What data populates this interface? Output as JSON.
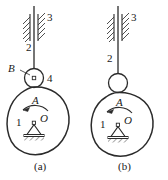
{
  "figure": {
    "stroke_color": "#2b2b2b",
    "hatch_color": "#3a3a3a",
    "label_color": "#1a1a1a",
    "background": "#ffffff"
  },
  "panels": [
    {
      "id": "a",
      "caption": "(a)",
      "labels": {
        "guide": "3",
        "rod": "2",
        "roller_point": "B",
        "roller_link": "4",
        "body_link": "1",
        "pivot": "O",
        "motion_arrow": "A"
      },
      "has_roller_pin": true,
      "has_point_B": true,
      "has_link_4": true
    },
    {
      "id": "b",
      "caption": "(b)",
      "labels": {
        "guide": "3",
        "rod": "2",
        "body_link": "1",
        "pivot": "O",
        "motion_arrow": "A"
      },
      "has_roller_pin": false,
      "has_point_B": false,
      "has_link_4": false
    }
  ]
}
